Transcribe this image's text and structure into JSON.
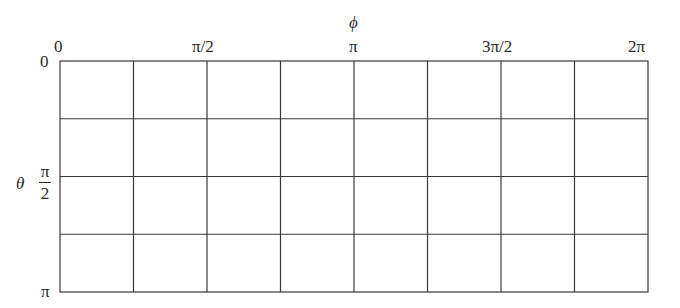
{
  "diagram": {
    "type": "grid",
    "x_axis": {
      "title": "ϕ",
      "ticks": [
        "0",
        "π/2",
        "π",
        "3π/2",
        "2π"
      ],
      "range": [
        "0",
        "2π"
      ]
    },
    "y_axis": {
      "title": "θ",
      "ticks": [
        "0",
        "π/2",
        "π"
      ],
      "tick_frac": {
        "num": "π",
        "den": "2"
      },
      "range": [
        "0",
        "π"
      ]
    },
    "grid": {
      "columns": 8,
      "rows": 4
    },
    "line_color": "#333333"
  }
}
